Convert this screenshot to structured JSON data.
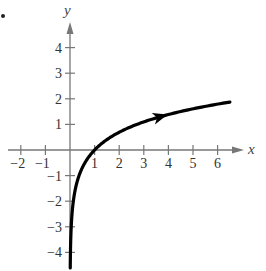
{
  "chart_data": {
    "type": "line",
    "title": "",
    "function": "y = ln(x)",
    "xlabel": "x",
    "ylabel": "y",
    "xlim": [
      -2.6,
      7.0
    ],
    "ylim": [
      -4.6,
      5.0
    ],
    "x_ticks": [
      -2,
      -1,
      1,
      2,
      3,
      4,
      5,
      6
    ],
    "y_ticks": [
      -4,
      -3,
      -2,
      -1,
      1,
      2,
      3,
      4
    ],
    "x_tick_labels": [
      "−2",
      "−1",
      "1",
      "2",
      "3",
      "4",
      "5",
      "6"
    ],
    "y_tick_labels": [
      "−4",
      "−3",
      "−2",
      "−1",
      "1",
      "2",
      "3",
      "4"
    ],
    "grid": false,
    "legend": "none",
    "series": [
      {
        "name": "ln(x)",
        "x": [
          0.01,
          0.02,
          0.05,
          0.1,
          0.2,
          0.3,
          0.5,
          0.75,
          1,
          1.5,
          2,
          2.5,
          3,
          3.5,
          4,
          4.5,
          5,
          5.5,
          6,
          6.5
        ],
        "y": [
          -4.6,
          -3.91,
          -3.0,
          -2.3,
          -1.61,
          -1.2,
          -0.69,
          -0.29,
          0,
          0.41,
          0.69,
          0.92,
          1.1,
          1.25,
          1.39,
          1.5,
          1.61,
          1.7,
          1.79,
          1.87
        ],
        "color": "#000000",
        "direction_arrow_at_x": 3.7
      }
    ]
  },
  "labels": {
    "bullet": "•",
    "x_axis": "x",
    "y_axis": "y"
  }
}
